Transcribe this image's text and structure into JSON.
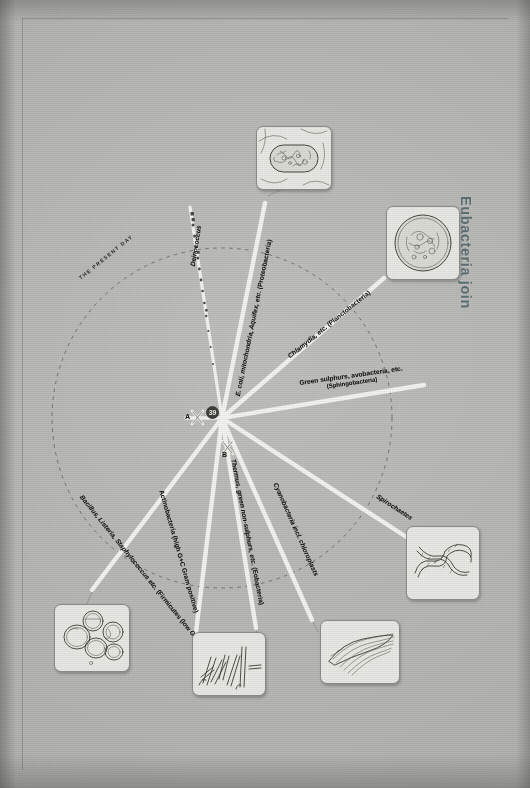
{
  "page": {
    "side_title": "Eubacteria join",
    "arc_label": "THE PRESENT DAY",
    "root_badge": "39",
    "node_a": "A",
    "node_b": "B"
  },
  "branches": [
    {
      "id": "deinococcus",
      "name": "Deinococcus",
      "sub": "",
      "label_rot": -82,
      "label_x": 193,
      "label_y": 262,
      "dotted": true
    },
    {
      "id": "proteobacteria",
      "name": "E. coli, mitochondria, Aquifex, etc.",
      "sub": "(Proteobacteria)",
      "label_rot": -68,
      "label_x": 236,
      "label_y": 382,
      "dotted": false
    },
    {
      "id": "planctobacteria",
      "name": "Chlamydia, etc.",
      "sub": "(Planctobacteria)",
      "label_rot": -27,
      "label_x": 288,
      "label_y": 357,
      "dotted": false
    },
    {
      "id": "sphingobacteria",
      "name": "Green sulphurs, avobacteria, etc.",
      "sub": "(Sphingobacteria)",
      "label_rot": 0,
      "label_x": 300,
      "label_y": 381,
      "dotted": false
    },
    {
      "id": "spirochaetes",
      "name": "Spirochaetes",
      "sub": "",
      "label_rot": 33,
      "label_x": 378,
      "label_y": 490,
      "dotted": false
    },
    {
      "id": "cyanobacteria",
      "name": "Cyanobacteria incl. chloroplasts",
      "sub": "",
      "label_rot": 57,
      "label_x": 276,
      "label_y": 478,
      "dotted": false
    },
    {
      "id": "eobacteria",
      "name": "Thermus, green non-sulphurs, etc.",
      "sub": "(Eobacteria)",
      "label_rot": 72,
      "label_x": 231,
      "label_y": 455,
      "dotted": false
    },
    {
      "id": "actinobacteria",
      "name": "Actinobacteria (high G+C Gram positive)",
      "sub": "",
      "label_rot": 71,
      "label_x": 163,
      "label_y": 487,
      "dotted": false
    },
    {
      "id": "firmicutes",
      "name": "Bacillus, Listeria, Staphylococcus etc.",
      "sub": "(Firmicutes (low G+C Gram positive))",
      "label_rot": 51,
      "label_x": 83,
      "label_y": 492,
      "dotted": false
    }
  ],
  "illustrations": [
    {
      "id": "ecoli-rod",
      "name": "rod-bacterium-illustration"
    },
    {
      "id": "chlamydia-cell",
      "name": "round-cell-illustration"
    },
    {
      "id": "spirochaete-coil",
      "name": "spiral-bacteria-illustration"
    },
    {
      "id": "cyano-filament",
      "name": "filamentous-cyanobacteria-illustration"
    },
    {
      "id": "bacilli-rods",
      "name": "rod-cluster-illustration"
    },
    {
      "id": "cocci-cluster",
      "name": "cocci-cluster-illustration"
    }
  ]
}
